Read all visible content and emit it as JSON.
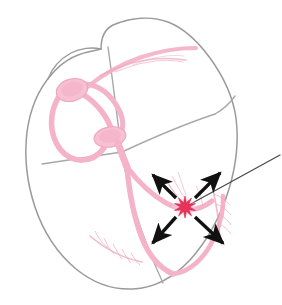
{
  "figure": {
    "title": "Cardiac conduction system with ectopic ventricular focus",
    "background_color": "#ffffff",
    "width": 282,
    "height": 305
  },
  "colors": {
    "outline": "#9a9a9a",
    "septum": "#a8a8a8",
    "conduction_pink": "#f4b3c8",
    "conduction_pink_light": "#f8cddc",
    "purkinje_pink": "#eca8bf",
    "focus_red": "#e8335c",
    "focus_halo": "#f7b9cb",
    "arrow_black": "#111111",
    "leader_line": "#4a4a4a"
  },
  "structures": {
    "heart_outline": {
      "name": "heart-outline",
      "label": "Heart silhouette"
    },
    "chambers": [
      {
        "id": "right-atrium",
        "label": "Right atrium"
      },
      {
        "id": "left-atrium",
        "label": "Left atrium"
      },
      {
        "id": "right-ventricle",
        "label": "Right ventricle"
      },
      {
        "id": "left-ventricle",
        "label": "Left ventricle"
      }
    ],
    "conduction": [
      {
        "id": "sa-node",
        "label": "Sinoatrial (SA) node",
        "cx": 72,
        "cy": 90,
        "rx": 16,
        "ry": 11,
        "rotation": -16
      },
      {
        "id": "av-node",
        "label": "Atrioventricular (AV) node",
        "cx": 110,
        "cy": 137,
        "rx": 16,
        "ry": 10,
        "rotation": -10
      },
      {
        "id": "internodal-pathways",
        "label": "Internodal pathways"
      },
      {
        "id": "bundle-of-his",
        "label": "Bundle of His"
      },
      {
        "id": "right-bundle-branch",
        "label": "Right bundle branch"
      },
      {
        "id": "left-bundle-branch",
        "label": "Left bundle branch"
      },
      {
        "id": "purkinje-fibers",
        "label": "Purkinje fibers"
      },
      {
        "id": "atrial-fibers",
        "label": "Atrial conduction fibers"
      }
    ],
    "ectopic_focus": {
      "id": "ectopic-focus",
      "label": "Ectopic focus",
      "cx": 185,
      "cy": 207,
      "outer_radius": 11,
      "inner_radius": 4.6,
      "points": 10,
      "halo_radius": 13
    },
    "impulse_arrows": [
      {
        "id": "arrow-upper-left",
        "label": "Impulse spread superior-left",
        "x1": 176,
        "y1": 198,
        "x2": 150,
        "y2": 172
      },
      {
        "id": "arrow-upper-right",
        "label": "Impulse spread superior-right",
        "x1": 195,
        "y1": 198,
        "x2": 223,
        "y2": 170
      },
      {
        "id": "arrow-lower-left",
        "label": "Impulse spread inferior-left",
        "x1": 176,
        "y1": 217,
        "x2": 150,
        "y2": 246
      },
      {
        "id": "arrow-lower-right",
        "label": "Impulse spread inferior-right",
        "x1": 195,
        "y1": 217,
        "x2": 226,
        "y2": 246
      }
    ],
    "leader_line": {
      "id": "focus-leader-line",
      "label": "Leader line to ectopic focus",
      "x1": 187,
      "y1": 206,
      "x2": 280,
      "y2": 155
    }
  }
}
